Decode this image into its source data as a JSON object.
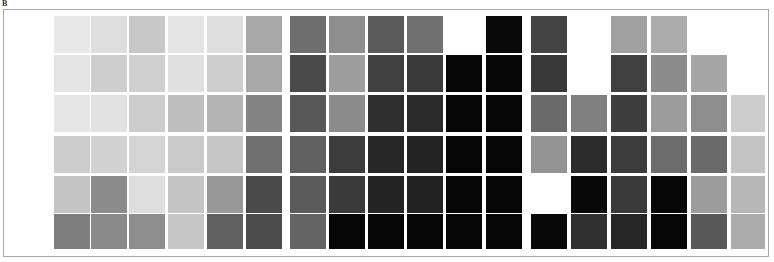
{
  "panel_label": "B",
  "chart_data": {
    "type": "heatmap",
    "title": "",
    "xlabel": "",
    "ylabel": "",
    "grid": false,
    "legend": null,
    "colormap": "grayscale (darker = higher value)",
    "value_encoding": "cell gray level as hex intensity, null = empty cell",
    "groups": [
      {
        "name": "group-1",
        "columns": 6,
        "rows": [
          [
            "#e8e8e8",
            "#dedede",
            "#c8c8c8",
            "#e4e4e4",
            "#dedede",
            "#a8a8a8"
          ],
          [
            "#e4e4e4",
            "#cecece",
            "#d0d0d0",
            "#e0e0e0",
            "#cecece",
            "#a8a8a8"
          ],
          [
            "#e6e6e6",
            "#e2e2e2",
            "#cccccc",
            "#bebebe",
            "#b4b4b4",
            "#848484"
          ],
          [
            "#cccccc",
            "#d2d2d2",
            "#d4d4d4",
            "#cacaca",
            "#c6c6c6",
            "#707070"
          ],
          [
            "#c4c4c4",
            "#8c8c8c",
            "#dedede",
            "#c4c4c4",
            "#989898",
            "#4a4a4a"
          ],
          [
            "#7e7e7e",
            "#8a8a8a",
            "#8e8e8e",
            "#c6c6c6",
            "#606060",
            "#4c4c4c"
          ]
        ]
      },
      {
        "name": "group-2",
        "columns": 6,
        "rows": [
          [
            "#6e6e6e",
            "#8e8e8e",
            "#5a5a5a",
            "#707070",
            null,
            "#0a0a0a"
          ],
          [
            "#4a4a4a",
            "#9e9e9e",
            "#404040",
            "#3a3a3a",
            "#060606",
            "#060606"
          ],
          [
            "#585858",
            "#8c8c8c",
            "#2e2e2e",
            "#2a2a2a",
            "#060606",
            "#060606"
          ],
          [
            "#606060",
            "#3c3c3c",
            "#262626",
            "#242424",
            "#060606",
            "#060606"
          ],
          [
            "#5a5a5a",
            "#3a3a3a",
            "#242424",
            "#222222",
            "#060606",
            "#060606"
          ],
          [
            "#646464",
            "#060606",
            "#060606",
            "#060606",
            "#060606",
            "#060606"
          ]
        ]
      },
      {
        "name": "group-3",
        "columns": 6,
        "rows": [
          [
            "#444444",
            null,
            "#a0a0a0",
            "#acacac",
            null,
            null
          ],
          [
            "#383838",
            null,
            "#404040",
            "#8c8c8c",
            "#a6a6a6",
            null
          ],
          [
            "#6a6a6a",
            "#808080",
            "#3e3e3e",
            "#9c9c9c",
            "#8e8e8e",
            "#cccccc"
          ],
          [
            "#949494",
            "#2c2c2c",
            "#3c3c3c",
            "#6c6c6c",
            "#6a6a6a",
            "#c4c4c4"
          ],
          [
            null,
            "#080808",
            "#3a3a3a",
            "#060606",
            "#9c9c9c",
            "#b8b8b8"
          ],
          [
            "#080808",
            "#303030",
            "#262626",
            "#060606",
            "#585858",
            "#acacac"
          ]
        ]
      }
    ]
  }
}
